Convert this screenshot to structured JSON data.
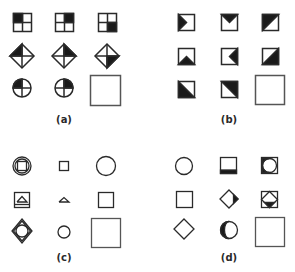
{
  "figure": {
    "panels": [
      {
        "id": "a",
        "label": "(a)",
        "cells": [
          [
            "square-quadrants-filled-top-left",
            "square-quadrants-filled-top-right",
            "square-quadrants-filled-bottom-right"
          ],
          [
            "diamond-quadrants-filled-left-top",
            "diamond-quadrants-filled-right-top",
            "diamond-quadrants-filled-right-bottom"
          ],
          [
            "circle-quadrants-filled-top-left",
            "circle-quadrants-filled-top-right",
            "answer-blank"
          ]
        ]
      },
      {
        "id": "b",
        "label": "(b)",
        "cells": [
          [
            "square-black-triangle-left",
            "square-black-triangle-top",
            "square-black-half-top-left"
          ],
          [
            "square-black-triangle-bottom",
            "square-black-triangle-right",
            "square-black-half-bottom-right"
          ],
          [
            "square-black-half-bottom-left",
            "square-black-half-top-right",
            "answer-blank"
          ]
        ]
      },
      {
        "id": "c",
        "label": "(c)",
        "cells": [
          [
            "circle-with-square-inside",
            "small-square",
            "circle"
          ],
          [
            "square-with-triangle-and-line",
            "small-triangle",
            "square"
          ],
          [
            "diamond-with-circle-inside",
            "small-circle",
            "answer-blank"
          ]
        ]
      },
      {
        "id": "d",
        "label": "(d)",
        "cells": [
          [
            "circle",
            "square-black-bottom-band",
            "square-with-circle-black-left"
          ],
          [
            "square",
            "diamond-black-right",
            "square-with-diamond-black-bottom"
          ],
          [
            "diamond",
            "circle-black-left",
            "answer-blank"
          ]
        ]
      }
    ]
  },
  "colors": {
    "stroke": "#2a2a2a",
    "fill": "#1a1a1a",
    "background": "#ffffff"
  }
}
